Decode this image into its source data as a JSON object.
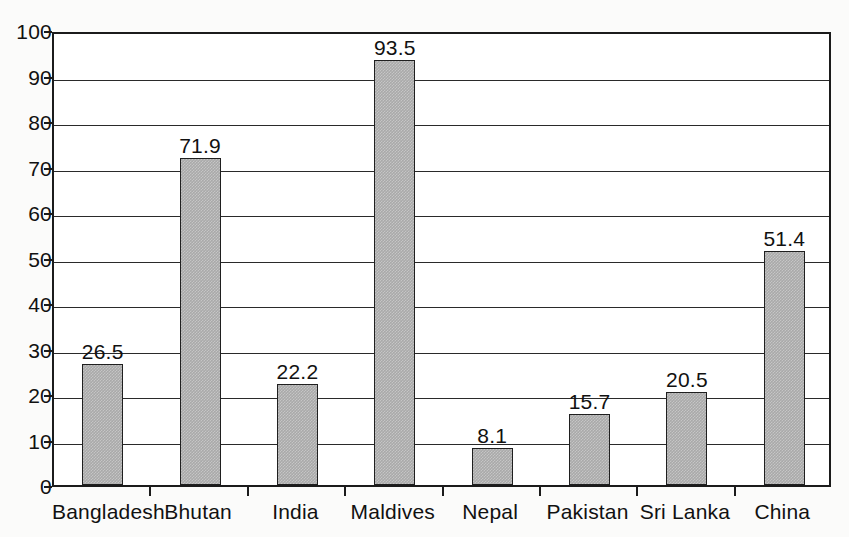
{
  "chart_data": {
    "type": "bar",
    "title": "",
    "subtitle": "",
    "xlabel": "",
    "ylabel": "",
    "categories": [
      "Bangladesh",
      "Bhutan",
      "India",
      "Maldives",
      "Nepal",
      "Pakistan",
      "Sri Lanka",
      "China"
    ],
    "values": [
      26.5,
      71.9,
      22.2,
      93.5,
      8.1,
      15.7,
      20.5,
      51.4
    ],
    "data_labels": [
      "26.5",
      "71.9",
      "22.2",
      "93.5",
      "8.1",
      "15.7",
      "20.5",
      "51.4"
    ],
    "ylim": [
      0,
      100
    ],
    "ytick_values": [
      0,
      10,
      20,
      30,
      40,
      50,
      60,
      70,
      80,
      90,
      100
    ],
    "ytick_labels": [
      "0",
      "10",
      "20",
      "30",
      "40",
      "50",
      "60",
      "70",
      "80",
      "90",
      "100"
    ],
    "grid": true,
    "grid_axis": "y",
    "legend": false,
    "legend_position": "none",
    "bar_fill_color": "#a9a9a9",
    "bar_edge_color": "#1f1f1f",
    "axis_color": "#1b1b1b",
    "background_color": "#ffffff"
  }
}
